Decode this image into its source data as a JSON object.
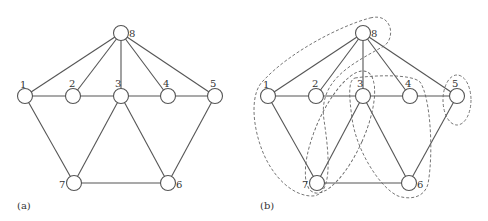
{
  "figures": [
    {
      "caption": "(a)",
      "nodes": [
        {
          "id": "1",
          "label": "1"
        },
        {
          "id": "2",
          "label": "2"
        },
        {
          "id": "3",
          "label": "3"
        },
        {
          "id": "4",
          "label": "4"
        },
        {
          "id": "5",
          "label": "5"
        },
        {
          "id": "6",
          "label": "6"
        },
        {
          "id": "7",
          "label": "7"
        },
        {
          "id": "8",
          "label": "8"
        }
      ],
      "edges": [
        [
          "8",
          "1"
        ],
        [
          "8",
          "2"
        ],
        [
          "8",
          "3"
        ],
        [
          "8",
          "4"
        ],
        [
          "8",
          "5"
        ],
        [
          "1",
          "2"
        ],
        [
          "2",
          "3"
        ],
        [
          "3",
          "4"
        ],
        [
          "4",
          "5"
        ],
        [
          "1",
          "7"
        ],
        [
          "3",
          "7"
        ],
        [
          "3",
          "6"
        ],
        [
          "5",
          "6"
        ],
        [
          "7",
          "6"
        ]
      ]
    },
    {
      "caption": "(b)",
      "nodes": [
        {
          "id": "1",
          "label": "1"
        },
        {
          "id": "2",
          "label": "2"
        },
        {
          "id": "3",
          "label": "3"
        },
        {
          "id": "4",
          "label": "4"
        },
        {
          "id": "5",
          "label": "5"
        },
        {
          "id": "6",
          "label": "6"
        },
        {
          "id": "7",
          "label": "7"
        },
        {
          "id": "8",
          "label": "8"
        }
      ],
      "edges": [
        [
          "8",
          "1"
        ],
        [
          "8",
          "2"
        ],
        [
          "8",
          "3"
        ],
        [
          "8",
          "4"
        ],
        [
          "8",
          "5"
        ],
        [
          "1",
          "2"
        ],
        [
          "2",
          "3"
        ],
        [
          "3",
          "4"
        ],
        [
          "4",
          "5"
        ],
        [
          "1",
          "7"
        ],
        [
          "3",
          "7"
        ],
        [
          "3",
          "6"
        ],
        [
          "5",
          "6"
        ],
        [
          "7",
          "6"
        ]
      ],
      "clusters": [
        {
          "name": "cluster-1-7-8",
          "members": [
            "1",
            "7",
            "8"
          ]
        },
        {
          "name": "cluster-2-3-7",
          "members": [
            "2",
            "3",
            "7"
          ]
        },
        {
          "name": "cluster-3-4-6",
          "members": [
            "3",
            "4",
            "6"
          ]
        },
        {
          "name": "cluster-5",
          "members": [
            "5"
          ]
        }
      ]
    }
  ]
}
